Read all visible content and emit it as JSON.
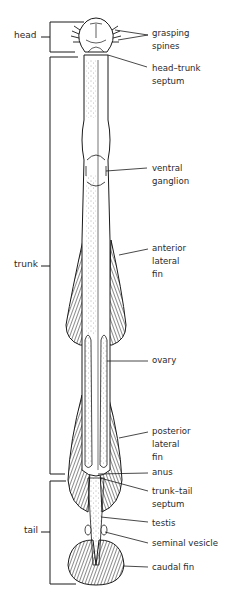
{
  "diagram": {
    "regions": [
      {
        "id": "head",
        "label": "head"
      },
      {
        "id": "trunk",
        "label": "trunk"
      },
      {
        "id": "tail",
        "label": "tail"
      }
    ],
    "labels": [
      {
        "id": "grasping-spines",
        "text": "grasping\nspines"
      },
      {
        "id": "head-trunk-septum",
        "text": "head–trunk\nseptum"
      },
      {
        "id": "ventral-ganglion",
        "text": "ventral\nganglion"
      },
      {
        "id": "anterior-lateral-fin",
        "text": "anterior\nlateral\nfin"
      },
      {
        "id": "ovary",
        "text": "ovary"
      },
      {
        "id": "posterior-lateral-fin",
        "text": "posterior\nlateral\nfin"
      },
      {
        "id": "anus",
        "text": "anus"
      },
      {
        "id": "trunk-tail-septum",
        "text": "trunk–tail\nseptum"
      },
      {
        "id": "testis",
        "text": "testis"
      },
      {
        "id": "seminal-vesicle",
        "text": "seminal vesicle"
      },
      {
        "id": "caudal-fin",
        "text": "caudal fin"
      }
    ],
    "colors": {
      "ink": "#1a1a1a",
      "background": "#ffffff"
    }
  }
}
